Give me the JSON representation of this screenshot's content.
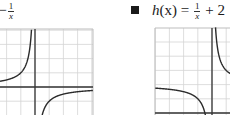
{
  "figures": [
    {
      "id": "g",
      "bullet": false,
      "label": {
        "prefix": "= −",
        "frac_num": "1",
        "frac_den": "x",
        "suffix": ""
      },
      "function": "-1/x",
      "grid": {
        "x0": -1,
        "y0": 29,
        "x1": 93,
        "y1": 115,
        "cell": 14.2
      },
      "axes": {
        "y_axis_x": 35,
        "x_axis_y": 87
      }
    },
    {
      "id": "h",
      "bullet": true,
      "label": {
        "name": "h",
        "arg": "(x)",
        "eq": " = ",
        "frac_num": "1",
        "frac_den": "x",
        "suffix": " + 2"
      },
      "function": "1/x + 2",
      "grid": {
        "x0": 155,
        "y0": 28,
        "x1": 231,
        "y1": 115,
        "cell": 14.2
      },
      "axes": {
        "y_axis_x": 212,
        "x_axis_y": 113
      }
    }
  ],
  "colors": {
    "grid": "#d4d4d4",
    "frame": "#bdbdbd",
    "axis": "#333333",
    "curve": "#2b2b2b"
  }
}
